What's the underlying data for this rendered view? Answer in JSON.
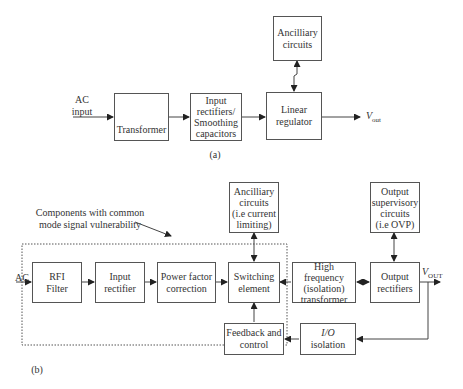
{
  "diagram_a": {
    "caption": "(a)",
    "input_label_line1": "AC",
    "input_label_line2": "input",
    "blocks": {
      "transformer": "Transformer",
      "rectifiers_line1": "Input",
      "rectifiers_line2": "rectifiers/",
      "rectifiers_line3": "Smoothing",
      "rectifiers_line4": "capacitors",
      "regulator_line1": "Linear",
      "regulator_line2": "regulator",
      "ancillary_line1": "Ancilliary",
      "ancillary_line2": "circuits"
    },
    "output_label": "V",
    "output_sub": "out"
  },
  "diagram_b": {
    "caption": "(b)",
    "annotation_line1": "Components with common",
    "annotation_line2": "mode signal vulnerability",
    "input_label": "AC",
    "blocks": {
      "rfi_line1": "RFI",
      "rfi_line2": "Filter",
      "input_rect_line1": "Input",
      "input_rect_line2": "rectifier",
      "pfc_line1": "Power factor",
      "pfc_line2": "correction",
      "switching_line1": "Switching",
      "switching_line2": "element",
      "ancillary_line1": "Ancilliary",
      "ancillary_line2": "circuits",
      "ancillary_line3": "(i.e current",
      "ancillary_line4": "limiting)",
      "hf_line1": "High frequency",
      "hf_line2": "(isolation)",
      "hf_line3": "transformer",
      "outrect_line1": "Output",
      "outrect_line2": "rectifiers",
      "supervisory_line1": "Output",
      "supervisory_line2": "supervisory",
      "supervisory_line3": "circuits",
      "supervisory_line4": "(i.e OVP)",
      "feedback_line1": "Feedback and",
      "feedback_line2": "control",
      "io_line1": "I/O",
      "io_line2": "isolation"
    },
    "output_label": "V",
    "output_sub": "OUT"
  }
}
